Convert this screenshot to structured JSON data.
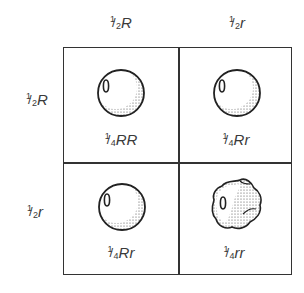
{
  "columns": [
    {
      "fraction_num": "1",
      "fraction_den": "2",
      "allele": "R"
    },
    {
      "fraction_num": "1",
      "fraction_den": "2",
      "allele": "r"
    }
  ],
  "rows": [
    {
      "fraction_num": "1",
      "fraction_den": "2",
      "allele": "R"
    },
    {
      "fraction_num": "1",
      "fraction_den": "2",
      "allele": "r"
    }
  ],
  "cells": [
    {
      "fraction_num": "1",
      "fraction_den": "4",
      "genotype": "RR",
      "phenotype": "round-seed"
    },
    {
      "fraction_num": "1",
      "fraction_den": "4",
      "genotype": "Rr",
      "phenotype": "round-seed"
    },
    {
      "fraction_num": "1",
      "fraction_den": "4",
      "genotype": "Rr",
      "phenotype": "round-seed"
    },
    {
      "fraction_num": "1",
      "fraction_den": "4",
      "genotype": "rr",
      "phenotype": "wrinkled-seed"
    }
  ],
  "colors": {
    "line": "#333333",
    "text": "#3a3a3a",
    "background": "#ffffff"
  }
}
